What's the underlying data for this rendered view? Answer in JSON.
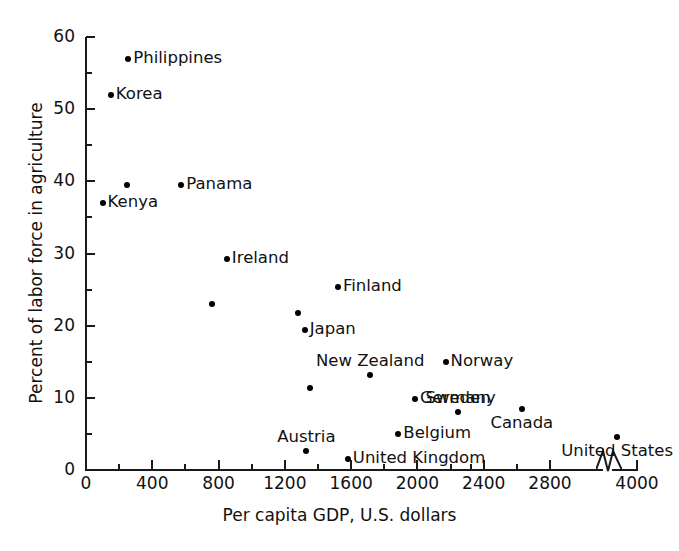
{
  "chart_data": {
    "type": "scatter",
    "title": "",
    "xlabel": "Per capita GDP, U.S. dollars",
    "ylabel": "Percent of labor force in agriculture",
    "xlim": [
      0,
      4000
    ],
    "ylim": [
      0,
      60
    ],
    "grid": false,
    "legend": "none",
    "x_major_ticks": [
      0,
      400,
      800,
      1200,
      1600,
      2000,
      2400,
      2800,
      4000
    ],
    "x_minor_ticks": [
      200,
      600,
      1000,
      1400,
      1800,
      2200,
      2600,
      3000
    ],
    "y_major_ticks": [
      0,
      10,
      20,
      30,
      40,
      50,
      60
    ],
    "y_minor_ticks": [
      5,
      15,
      25,
      35,
      45,
      55
    ],
    "axis_break": {
      "between": [
        2800,
        4000
      ],
      "symbol": "zigzag"
    },
    "points": [
      {
        "label": "Philippines",
        "x": 255,
        "y": 57,
        "label_side": "right"
      },
      {
        "label": "Korea",
        "x": 150,
        "y": 52,
        "label_side": "right"
      },
      {
        "label": "",
        "x": 250,
        "y": 39.5,
        "label_side": "none"
      },
      {
        "label": "Panama",
        "x": 575,
        "y": 39.5,
        "label_side": "right"
      },
      {
        "label": "Kenya",
        "x": 100,
        "y": 37,
        "label_side": "right"
      },
      {
        "label": "Ireland",
        "x": 850,
        "y": 29.3,
        "label_side": "right"
      },
      {
        "label": "",
        "x": 760,
        "y": 23,
        "label_side": "none"
      },
      {
        "label": "Finland",
        "x": 1520,
        "y": 25.3,
        "label_side": "right"
      },
      {
        "label": "",
        "x": 1280,
        "y": 21.8,
        "label_side": "none"
      },
      {
        "label": "Japan",
        "x": 1320,
        "y": 19.4,
        "label_side": "right"
      },
      {
        "label": "Norway",
        "x": 2170,
        "y": 15,
        "label_side": "right"
      },
      {
        "label": "New Zealand",
        "x": 1715,
        "y": 13.2,
        "label_side": "above"
      },
      {
        "label": "",
        "x": 1350,
        "y": 11.4,
        "label_side": "none"
      },
      {
        "label": "Germany",
        "x": 1985,
        "y": 9.9,
        "label_side": "right"
      },
      {
        "label": "Canada",
        "x": 2630,
        "y": 8.5,
        "label_side": "below"
      },
      {
        "label": "Sweden",
        "x": 2920,
        "y": 8.0,
        "label_side": "above"
      },
      {
        "label": "Belgium",
        "x": 1885,
        "y": 5.0,
        "label_side": "right"
      },
      {
        "label": "United States",
        "x": 3880,
        "y": 4.6,
        "label_side": "below"
      },
      {
        "label": "Austria",
        "x": 1330,
        "y": 2.7,
        "label_side": "above"
      },
      {
        "label": "United Kingdom",
        "x": 1580,
        "y": 1.5,
        "label_side": "right"
      }
    ]
  },
  "axes": {
    "x_title": "Per capita GDP, U.S. dollars",
    "y_title": "Percent of labor force in agriculture",
    "x_tick_labels": [
      "0",
      "400",
      "800",
      "1200",
      "1600",
      "2000",
      "2400",
      "2800",
      "4000"
    ],
    "y_tick_labels": [
      "0",
      "10",
      "20",
      "30",
      "40",
      "50",
      "60"
    ]
  },
  "colors": {
    "ink": "#111111",
    "point": "#000000",
    "background": "#ffffff"
  }
}
